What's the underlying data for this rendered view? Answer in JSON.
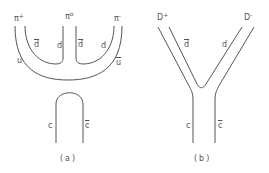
{
  "diagram": {
    "panel_a": {
      "caption": "(a)",
      "mesons": [
        {
          "name": "π",
          "charge": "+"
        },
        {
          "name": "π",
          "charge": "o"
        },
        {
          "name": "π",
          "charge": "-"
        }
      ],
      "quark_labels": {
        "u": "u",
        "dbar_left": "d",
        "d_left": "d",
        "dbar_right": "d",
        "d_right": "d",
        "ubar": "u",
        "c": "c",
        "cbar": "c"
      }
    },
    "panel_b": {
      "caption": "(b)",
      "mesons": [
        {
          "name": "D",
          "charge": "+"
        },
        {
          "name": "D",
          "charge": "-"
        }
      ],
      "quark_labels": {
        "dbar": "d",
        "d": "d",
        "c": "c",
        "cbar": "c"
      }
    },
    "line_color": "#555555"
  }
}
